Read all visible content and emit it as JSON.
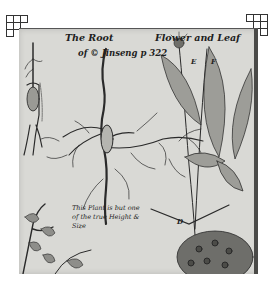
{
  "image": {
    "description": "Antique botanical copperplate engraving of the ginseng plant showing root, flower and leaf",
    "title_line1_left": "The Root",
    "title_line1_right": "Flower and Leaf",
    "title_line2": "of © Jinseng p 322",
    "caption_note": "This Plant is but one of the true Height & Size",
    "figure_labels": [
      "E",
      "F",
      "D"
    ],
    "corner_marks": [
      "crop-mark-top-left",
      "crop-mark-top-right"
    ],
    "colors": {
      "paper": "#d9d9d5",
      "ink": "#1e1e1e",
      "background": "#ffffff"
    }
  }
}
